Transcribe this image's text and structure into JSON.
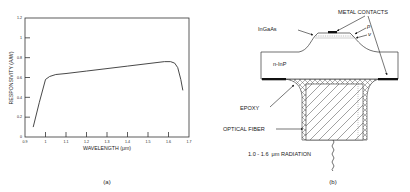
{
  "panel_a": {
    "caption": "(a)"
  },
  "panel_b": {
    "caption": "(b)",
    "labels": {
      "metal_contacts": "METAL CONTACTS",
      "ingaas": "InGaAs",
      "p": "p",
      "nu": "ν",
      "n_inp": "n-InP",
      "epoxy": "EPOXY",
      "optical_fiber": "OPTICAL FIBER",
      "radiation_range": "1.0 - 1.6",
      "radiation_unit": "μm RADIATION"
    }
  },
  "chart_data": {
    "type": "line",
    "title": "",
    "xlabel": "WAVELENGTH (μm)",
    "ylabel": "RESPONSIVITY (A/W)",
    "xlim": [
      0.9,
      1.7
    ],
    "ylim": [
      0,
      1.2
    ],
    "x_ticks": [
      "0.9",
      "1",
      "1.1",
      "1.2",
      "1.3",
      "1.4",
      "1.5",
      "1.6",
      "1.7"
    ],
    "y_ticks": [
      "0",
      "0.2",
      "0.4",
      "0.6",
      "0.8",
      "1",
      "1.2"
    ],
    "grid": false,
    "legend": null,
    "series": [
      {
        "name": "Responsivity",
        "x": [
          0.94,
          0.97,
          1.0,
          1.02,
          1.05,
          1.1,
          1.2,
          1.3,
          1.4,
          1.5,
          1.58,
          1.61,
          1.63,
          1.645,
          1.66,
          1.67
        ],
        "y": [
          0.1,
          0.35,
          0.58,
          0.61,
          0.63,
          0.64,
          0.665,
          0.69,
          0.715,
          0.74,
          0.76,
          0.76,
          0.745,
          0.7,
          0.58,
          0.47
        ]
      }
    ]
  }
}
